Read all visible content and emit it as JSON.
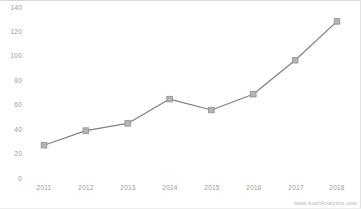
{
  "watermark": {
    "text": "www.AuditAnalytics.com"
  },
  "colors": {
    "line": "#7f7f7f",
    "marker_fill": "#b3b3b3",
    "marker_stroke": "#8c8c8c",
    "tick_text": "#9a9a9a",
    "background": "#ffffff",
    "frame": "#d8d8d8"
  },
  "chart_data": {
    "type": "line",
    "title": "",
    "subtitle": "",
    "xlabel": "",
    "ylabel": "",
    "categories": [
      "2011",
      "2012",
      "2013",
      "2014",
      "2015",
      "2016",
      "2017",
      "2018"
    ],
    "values": [
      27,
      39,
      45,
      65,
      56,
      69,
      97,
      129
    ],
    "series": [
      {
        "name": "Series 1",
        "values": [
          27,
          39,
          45,
          65,
          56,
          69,
          97,
          129
        ]
      }
    ],
    "ylim": [
      0,
      140
    ],
    "yticks": [
      0,
      20,
      40,
      60,
      80,
      100,
      120,
      140
    ],
    "ytick_labels": [
      "0",
      "20",
      "40",
      "60",
      "80",
      "100",
      "120",
      "140"
    ],
    "xtick_labels": [
      "2011",
      "2012",
      "2013",
      "2014",
      "2015",
      "2016",
      "2017",
      "2018"
    ],
    "grid": false,
    "legend": "none",
    "markers": "square",
    "annotations": []
  }
}
